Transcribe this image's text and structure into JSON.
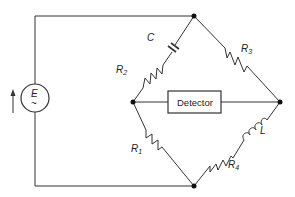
{
  "diagram": {
    "type": "AC bridge circuit",
    "source": {
      "label": "E",
      "symbol": "~"
    },
    "detector": {
      "label": "Detector"
    },
    "components": {
      "R1": {
        "label": "R",
        "sub": "1"
      },
      "R2": {
        "label": "R",
        "sub": "2"
      },
      "R3": {
        "label": "R",
        "sub": "3"
      },
      "R4": {
        "label": "R",
        "sub": "4"
      },
      "C": {
        "label": "C"
      },
      "L": {
        "label": "L"
      }
    },
    "colors": {
      "line": "#333333",
      "background": "#ffffff"
    }
  }
}
